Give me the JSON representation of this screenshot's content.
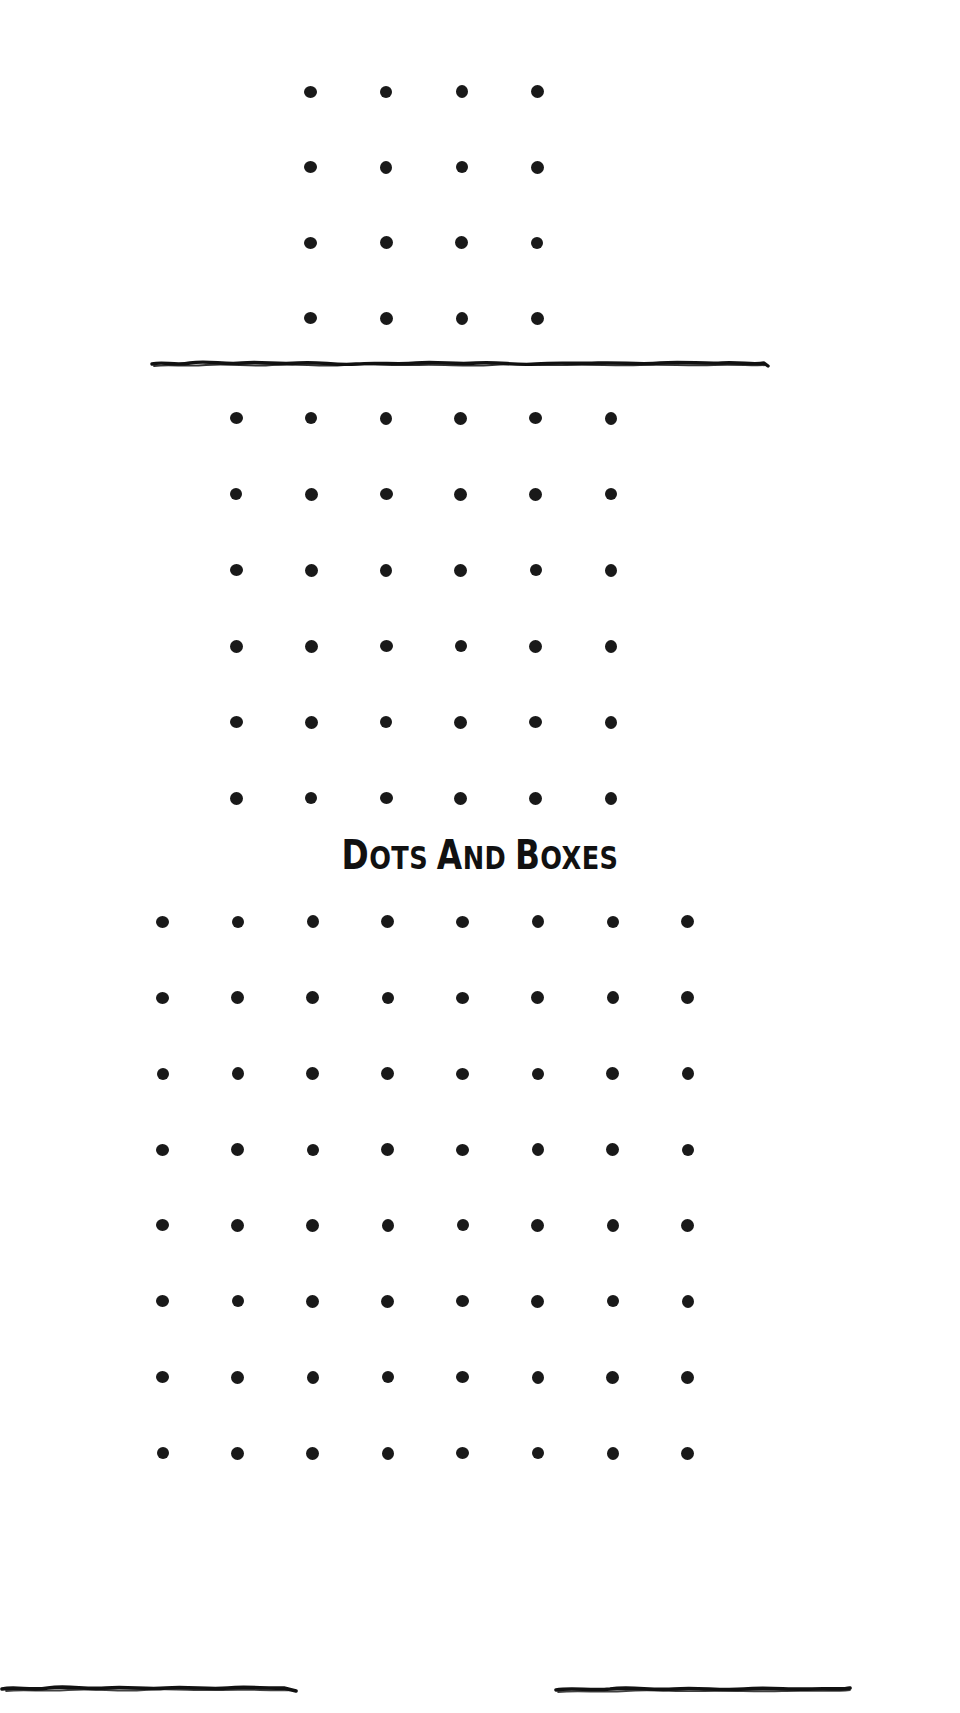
{
  "page": {
    "background_color": "#ffffff",
    "ink_color": "#191919",
    "width": 960,
    "height": 1713
  },
  "header": {
    "title_parts": [
      {
        "text": "D",
        "style": "cap"
      },
      {
        "text": "OTS",
        "style": "small-cap"
      },
      {
        "text": "A",
        "style": "cap"
      },
      {
        "text": "ND",
        "style": "small-cap"
      },
      {
        "text": "B",
        "style": "cap"
      },
      {
        "text": "OXES",
        "style": "small-cap"
      }
    ],
    "rule_left_label": "hand-drawn rule left",
    "rule_right_label": "hand-drawn rule right"
  },
  "dividers": [
    {
      "name": "divider-top",
      "label": "hand-drawn divider above middle grid"
    }
  ],
  "grids": [
    {
      "id": "grid-top",
      "label": "3 by 3 boxes game grid",
      "columns": 4,
      "rows": 4,
      "dot_count": 16,
      "boxes": "3 x 3"
    },
    {
      "id": "grid-middle",
      "label": "5 by 5 boxes game grid",
      "columns": 6,
      "rows": 6,
      "dot_count": 36,
      "boxes": "5 x 5"
    },
    {
      "id": "grid-bottom",
      "label": "7 by 7 boxes game grid",
      "columns": 8,
      "rows": 8,
      "dot_count": 64,
      "boxes": "7 x 7"
    }
  ]
}
